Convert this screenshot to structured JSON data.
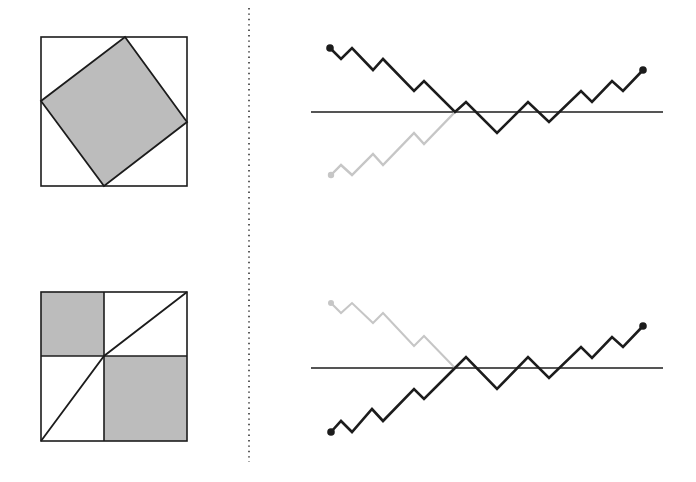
{
  "colors": {
    "background": "#ffffff",
    "stroke": "#1c1c1c",
    "fill_shaded": "#bcbcbc",
    "reflected_path": "#c6c6c6",
    "divider": "#333333"
  },
  "figures": {
    "top_left_square": {
      "description": "Unit square with an inscribed rotated shaded square",
      "outer": {
        "x": 41,
        "y": 37,
        "w": 146,
        "h": 149
      },
      "inner_polygon": [
        [
          125,
          37
        ],
        [
          187,
          122
        ],
        [
          104,
          186
        ],
        [
          41,
          101
        ]
      ]
    },
    "bottom_left_square": {
      "description": "Unit square split into quadrants, two opposite quadrants shaded, with a bent diagonal",
      "outer": {
        "x": 41,
        "y": 292,
        "w": 146,
        "h": 149
      },
      "split_x": 104,
      "split_y": 356,
      "shaded_rects": [
        {
          "x": 41,
          "y": 292,
          "w": 63,
          "h": 64
        },
        {
          "x": 104,
          "y": 356,
          "w": 83,
          "h": 85
        }
      ],
      "diagonal": [
        [
          41,
          441
        ],
        [
          104,
          356
        ],
        [
          187,
          292
        ]
      ]
    },
    "divider": {
      "x": 249,
      "y1": 8,
      "y2": 462,
      "dash": "1.4 4"
    },
    "top_right_paths": {
      "description": "Lattice path crossing the axis, with reflected initial segment (grey)",
      "axis": {
        "x1": 311,
        "x2": 663,
        "y": 112
      },
      "black_path": [
        [
          330,
          48
        ],
        [
          341,
          59
        ],
        [
          352,
          48
        ],
        [
          373,
          70
        ],
        [
          383,
          59
        ],
        [
          414,
          91
        ],
        [
          424,
          81
        ],
        [
          455,
          112
        ],
        [
          466,
          102
        ],
        [
          497,
          133
        ],
        [
          528,
          102
        ],
        [
          549,
          122
        ],
        [
          581,
          91
        ],
        [
          592,
          102
        ],
        [
          612,
          81
        ],
        [
          623,
          91
        ],
        [
          643,
          70
        ]
      ],
      "grey_path": [
        [
          331,
          175
        ],
        [
          341,
          165
        ],
        [
          352,
          175
        ],
        [
          373,
          154
        ],
        [
          383,
          165
        ],
        [
          414,
          133
        ],
        [
          424,
          144
        ],
        [
          455,
          112
        ]
      ],
      "start_dot": [
        330,
        48
      ],
      "end_dot": [
        643,
        70
      ],
      "grey_dot": [
        331,
        175
      ]
    },
    "bottom_right_paths": {
      "description": "Lattice path starting below axis, with reflected initial segment (grey) above",
      "axis": {
        "x1": 311,
        "x2": 663,
        "y": 368
      },
      "black_path": [
        [
          331,
          432
        ],
        [
          341,
          421
        ],
        [
          352,
          432
        ],
        [
          372,
          409
        ],
        [
          383,
          421
        ],
        [
          414,
          389
        ],
        [
          424,
          399
        ],
        [
          455,
          368
        ],
        [
          466,
          357
        ],
        [
          497,
          389
        ],
        [
          528,
          357
        ],
        [
          549,
          378
        ],
        [
          581,
          347
        ],
        [
          592,
          358
        ],
        [
          612,
          337
        ],
        [
          623,
          347
        ],
        [
          643,
          326
        ]
      ],
      "grey_path": [
        [
          331,
          303
        ],
        [
          341,
          313
        ],
        [
          352,
          303
        ],
        [
          373,
          323
        ],
        [
          383,
          313
        ],
        [
          414,
          346
        ],
        [
          424,
          336
        ],
        [
          455,
          368
        ]
      ],
      "start_dot": [
        331,
        432
      ],
      "end_dot": [
        643,
        326
      ],
      "grey_dot": [
        331,
        303
      ]
    }
  }
}
